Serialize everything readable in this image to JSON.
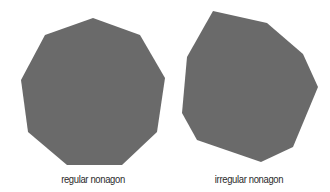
{
  "figure": {
    "background": "#ffffff",
    "fill_color": "#6a6a6a",
    "shapes": [
      {
        "id": "regular",
        "label": "regular nonagon",
        "points": "93,18 140,35 165,78 157,132 122,165 67,165 28,132 21,80 45,35"
      },
      {
        "id": "irregular",
        "label": "irregular nonagon",
        "points": "213,11 267,23 303,54 318,87 293,147 261,162 197,140 182,113 187,57"
      }
    ]
  }
}
